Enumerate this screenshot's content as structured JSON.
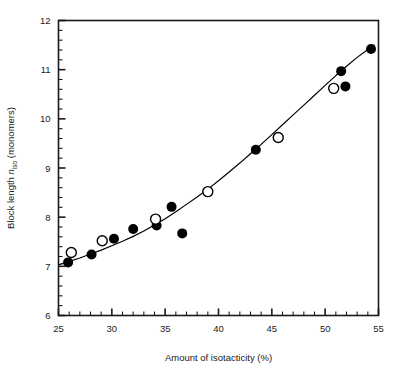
{
  "figure": {
    "name": "block-length-vs-isotacticity-scatter"
  },
  "chart_data": {
    "type": "scatter",
    "title": "",
    "subtitle": "",
    "xlabel": "Amount of isotacticity (%)",
    "ylabel_parts": {
      "pre": "Block length ",
      "symbol": "n",
      "symbol_subscript": "iso",
      "post": " (monomers)"
    },
    "ylabel": "Block length n_iso (monomers)",
    "xlim": [
      25,
      55
    ],
    "ylim": [
      6,
      12
    ],
    "xticks": [
      25,
      30,
      35,
      40,
      45,
      50,
      55
    ],
    "xtick_labels": [
      "25",
      "30",
      "35",
      "40",
      "45",
      "50",
      "55"
    ],
    "yticks": [
      6,
      7,
      8,
      9,
      10,
      11,
      12
    ],
    "ytick_labels": [
      "6",
      "7",
      "8",
      "9",
      "10",
      "11",
      "12"
    ],
    "x_minor_step": 1,
    "y_minor_step": 0.2,
    "grid": false,
    "legend": null,
    "legend_position": "none",
    "marker_colors": {
      "filled": "#000000",
      "open_stroke": "#000000",
      "open_fill": "#ffffff",
      "curve": "#000000",
      "frame": "#1a1a1a"
    },
    "series": [
      {
        "name": "filled-circles",
        "marker": "filled-circle",
        "points": [
          {
            "x": 25.9,
            "y": 7.08
          },
          {
            "x": 28.1,
            "y": 7.24
          },
          {
            "x": 30.2,
            "y": 7.56
          },
          {
            "x": 32.0,
            "y": 7.76
          },
          {
            "x": 34.2,
            "y": 7.83
          },
          {
            "x": 35.6,
            "y": 8.21
          },
          {
            "x": 36.6,
            "y": 7.67
          },
          {
            "x": 43.5,
            "y": 9.37
          },
          {
            "x": 51.5,
            "y": 10.97
          },
          {
            "x": 51.9,
            "y": 10.66
          },
          {
            "x": 54.3,
            "y": 11.42
          }
        ]
      },
      {
        "name": "open-circles",
        "marker": "open-circle",
        "points": [
          {
            "x": 26.2,
            "y": 7.28
          },
          {
            "x": 29.1,
            "y": 7.52
          },
          {
            "x": 34.1,
            "y": 7.96
          },
          {
            "x": 39.0,
            "y": 8.52
          },
          {
            "x": 45.6,
            "y": 9.62
          },
          {
            "x": 50.8,
            "y": 10.62
          }
        ]
      }
    ],
    "fit_curve": {
      "name": "fitted-trend-curve",
      "description": "smooth monotonic increasing curve through the data",
      "points": [
        {
          "x": 25.0,
          "y": 7.03
        },
        {
          "x": 26.0,
          "y": 7.1
        },
        {
          "x": 27.0,
          "y": 7.17
        },
        {
          "x": 28.0,
          "y": 7.25
        },
        {
          "x": 29.0,
          "y": 7.33
        },
        {
          "x": 30.0,
          "y": 7.42
        },
        {
          "x": 31.0,
          "y": 7.51
        },
        {
          "x": 32.0,
          "y": 7.61
        },
        {
          "x": 33.0,
          "y": 7.72
        },
        {
          "x": 34.0,
          "y": 7.84
        },
        {
          "x": 35.0,
          "y": 7.97
        },
        {
          "x": 36.0,
          "y": 8.11
        },
        {
          "x": 37.0,
          "y": 8.26
        },
        {
          "x": 38.0,
          "y": 8.41
        },
        {
          "x": 39.0,
          "y": 8.57
        },
        {
          "x": 40.0,
          "y": 8.74
        },
        {
          "x": 41.0,
          "y": 8.92
        },
        {
          "x": 42.0,
          "y": 9.1
        },
        {
          "x": 43.0,
          "y": 9.29
        },
        {
          "x": 44.0,
          "y": 9.48
        },
        {
          "x": 45.0,
          "y": 9.68
        },
        {
          "x": 46.0,
          "y": 9.88
        },
        {
          "x": 47.0,
          "y": 10.08
        },
        {
          "x": 48.0,
          "y": 10.28
        },
        {
          "x": 49.0,
          "y": 10.48
        },
        {
          "x": 50.0,
          "y": 10.68
        },
        {
          "x": 51.0,
          "y": 10.88
        },
        {
          "x": 52.0,
          "y": 11.07
        },
        {
          "x": 53.0,
          "y": 11.25
        },
        {
          "x": 54.0,
          "y": 11.41
        },
        {
          "x": 54.6,
          "y": 11.5
        }
      ]
    }
  }
}
